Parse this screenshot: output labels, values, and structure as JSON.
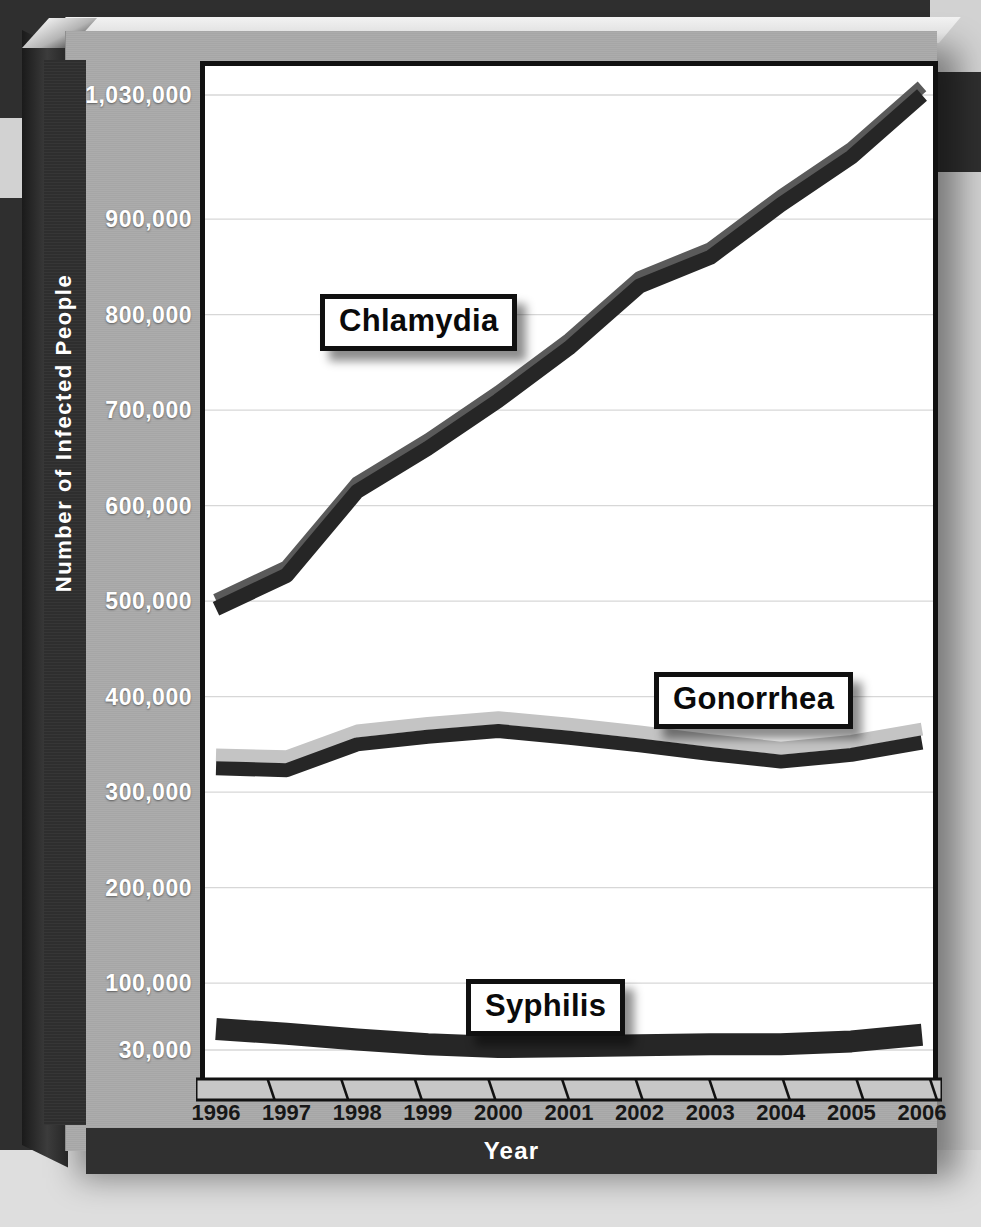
{
  "axes": {
    "y_title": "Number of Infected People",
    "x_title": "Year",
    "y_ticks": [
      "1,030,000",
      "900,000",
      "800,000",
      "700,000",
      "600,000",
      "500,000",
      "400,000",
      "300,000",
      "200,000",
      "100,000",
      "30,000"
    ],
    "x_ticks": [
      "1996",
      "1997",
      "1998",
      "1999",
      "2000",
      "2001",
      "2002",
      "2003",
      "2004",
      "2005",
      "2006"
    ]
  },
  "labels": {
    "chlamydia": "Chlamydia",
    "gonorrhea": "Gonorrhea",
    "syphilis": "Syphilis"
  },
  "colors": {
    "line_dark": "#262626",
    "line_highlight": "#c4c4c4",
    "plot_background": "#ffffff",
    "panel": "#a9a9a9",
    "strip_dark": "#303030",
    "gridline": "#d7d7d7"
  },
  "chart_data": {
    "type": "line",
    "title": "",
    "xlabel": "Year",
    "ylabel": "Number of Infected People",
    "x": [
      1996,
      1997,
      1998,
      1999,
      2000,
      2001,
      2002,
      2003,
      2004,
      2005,
      2006
    ],
    "ylim": [
      30000,
      1030000
    ],
    "ytick_values": [
      1030000,
      900000,
      800000,
      700000,
      600000,
      500000,
      400000,
      300000,
      200000,
      100000,
      30000
    ],
    "grid": true,
    "legend": "inline-callout-boxes",
    "series": [
      {
        "name": "Chlamydia",
        "values": [
          492000,
          527000,
          615000,
          660000,
          710000,
          765000,
          830000,
          860000,
          915000,
          965000,
          1030000
        ]
      },
      {
        "name": "Gonorrhea",
        "values": [
          325000,
          323000,
          350000,
          358000,
          364000,
          357000,
          349000,
          340000,
          332000,
          339000,
          352000
        ]
      },
      {
        "name": "Syphilis",
        "values": [
          52000,
          47000,
          41000,
          36000,
          33000,
          34000,
          35000,
          36000,
          36000,
          39000,
          46000
        ]
      }
    ]
  }
}
